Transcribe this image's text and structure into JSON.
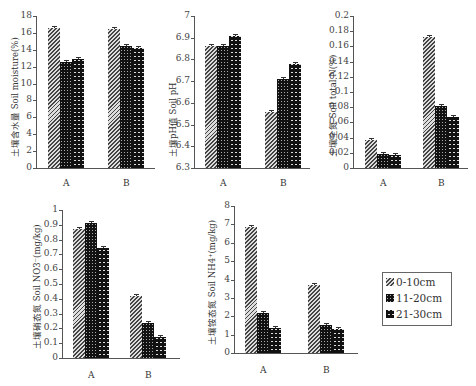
{
  "legend": {
    "items": [
      {
        "label": "0-10cm",
        "pattern": "p0"
      },
      {
        "label": "11-20cm",
        "pattern": "p1"
      },
      {
        "label": "21-30cm",
        "pattern": "p2"
      }
    ]
  },
  "chart_data": [
    {
      "type": "bar",
      "title": "",
      "ylabel": "土壤含水量 Soil moisture(%)",
      "xlabel": "",
      "categories": [
        "A",
        "B"
      ],
      "ylim": [
        0,
        18
      ],
      "yticks": [
        "0",
        "2",
        "4",
        "6",
        "8",
        "10",
        "12",
        "14",
        "16",
        "18"
      ],
      "series": [
        {
          "name": "0-10cm",
          "values": [
            16.6,
            16.5
          ]
        },
        {
          "name": "11-20cm",
          "values": [
            12.5,
            14.4
          ]
        },
        {
          "name": "21-30cm",
          "values": [
            12.9,
            14.2
          ]
        }
      ]
    },
    {
      "type": "bar",
      "title": "",
      "ylabel": "土壤pH值 Soil pH",
      "xlabel": "",
      "categories": [
        "A",
        "B"
      ],
      "ylim": [
        6.3,
        7
      ],
      "yticks": [
        "6.3",
        "6.4",
        "6.5",
        "6.6",
        "6.7",
        "6.8",
        "6.9",
        "7"
      ],
      "series": [
        {
          "name": "0-10cm",
          "values": [
            6.86,
            6.56
          ]
        },
        {
          "name": "11-20cm",
          "values": [
            6.86,
            6.71
          ]
        },
        {
          "name": "21-30cm",
          "values": [
            6.91,
            6.78
          ]
        }
      ]
    },
    {
      "type": "bar",
      "title": "",
      "ylabel": "土壤全氮 Soil total N(%)",
      "xlabel": "",
      "categories": [
        "A",
        "B"
      ],
      "ylim": [
        0,
        0.2
      ],
      "yticks": [
        "0",
        "0.02",
        "0.04",
        "0.06",
        "0.08",
        "0.1",
        "0.12",
        "0.14",
        "0.16",
        "0.18",
        "0.2"
      ],
      "series": [
        {
          "name": "0-10cm",
          "values": [
            0.037,
            0.173
          ]
        },
        {
          "name": "11-20cm",
          "values": [
            0.019,
            0.081
          ]
        },
        {
          "name": "21-30cm",
          "values": [
            0.017,
            0.067
          ]
        }
      ]
    },
    {
      "type": "bar",
      "title": "",
      "ylabel": "土壤硝态氮 Soil NO3⁻(mg/kg)",
      "xlabel": "",
      "categories": [
        "A",
        "B"
      ],
      "ylim": [
        0,
        1
      ],
      "yticks": [
        "0",
        "0.1",
        "0.2",
        "0.3",
        "0.4",
        "0.5",
        "0.6",
        "0.7",
        "0.8",
        "0.9",
        "1"
      ],
      "series": [
        {
          "name": "0-10cm",
          "values": [
            0.875,
            0.42
          ]
        },
        {
          "name": "11-20cm",
          "values": [
            0.915,
            0.235
          ]
        },
        {
          "name": "21-30cm",
          "values": [
            0.745,
            0.145
          ]
        }
      ]
    },
    {
      "type": "bar",
      "title": "",
      "ylabel": "土壤铵态氮 Soil NH4⁺(mg/kg)",
      "xlabel": "",
      "categories": [
        "A",
        "B"
      ],
      "ylim": [
        0,
        8
      ],
      "yticks": [
        "0",
        "1",
        "2",
        "3",
        "4",
        "5",
        "6",
        "7",
        "8"
      ],
      "series": [
        {
          "name": "0-10cm",
          "values": [
            6.85,
            3.7
          ]
        },
        {
          "name": "11-20cm",
          "values": [
            2.15,
            1.55
          ]
        },
        {
          "name": "21-30cm",
          "values": [
            1.35,
            1.3
          ]
        }
      ]
    }
  ]
}
